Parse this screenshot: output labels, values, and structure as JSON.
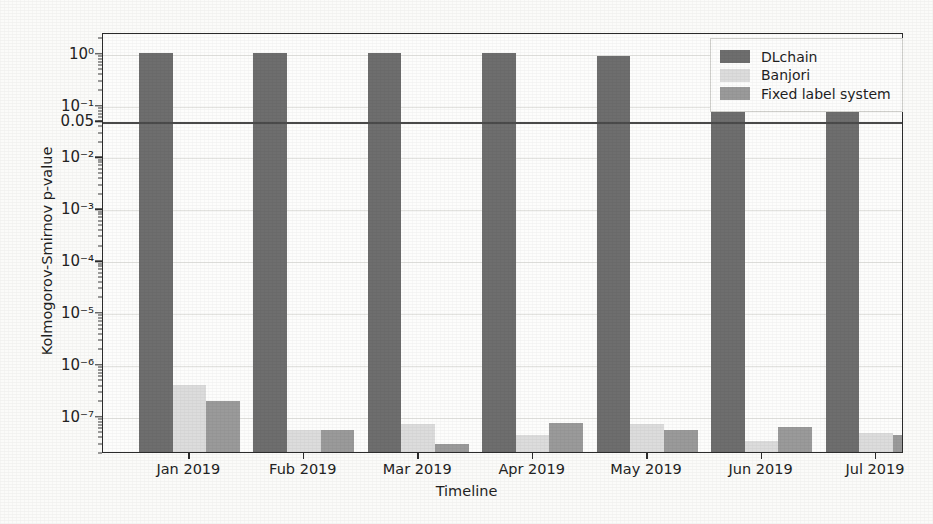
{
  "chart_data": {
    "type": "bar",
    "title": "",
    "xlabel": "Timeline",
    "ylabel": "Kolmogorov-Smirnov p-value",
    "yscale": "log",
    "ylim": [
      2e-08,
      2.5
    ],
    "grid": true,
    "legend_position": "top-right",
    "categories": [
      "Jan 2019",
      "Fub 2019",
      "Mar 2019",
      "Apr 2019",
      "May 2019",
      "Jun 2019",
      "Jul 2019"
    ],
    "series": [
      {
        "name": "DLchain",
        "color": "#6e6e6e",
        "values": [
          1.0,
          1.0,
          1.0,
          1.0,
          0.88,
          0.9,
          1.0
        ]
      },
      {
        "name": "Banjori",
        "color": "#dcdcdc",
        "values": [
          4e-07,
          5.2e-08,
          7e-08,
          4.2e-08,
          6.8e-08,
          3.2e-08,
          4.6e-08
        ]
      },
      {
        "name": "Fixed label system",
        "color": "#9a9a9a",
        "values": [
          1.9e-07,
          5.4e-08,
          2.8e-08,
          7.4e-08,
          5.3e-08,
          6e-08,
          4.2e-08
        ]
      }
    ],
    "ytick_labels": [
      "10⁰",
      "10⁻¹",
      "10⁻²",
      "10⁻³",
      "10⁻⁴",
      "10⁻⁵",
      "10⁻⁶",
      "10⁻⁷"
    ],
    "ytick_values": [
      1,
      0.1,
      0.01,
      0.001,
      0.0001,
      1e-05,
      1e-06,
      1e-07
    ],
    "threshold": {
      "label": "0.05",
      "value": 0.05,
      "color": "#4a4a4a"
    }
  },
  "legend": {
    "items": [
      {
        "label": "DLchain",
        "color": "#6e6e6e"
      },
      {
        "label": "Banjori",
        "color": "#dcdcdc"
      },
      {
        "label": "Fixed label system",
        "color": "#9a9a9a"
      }
    ]
  }
}
